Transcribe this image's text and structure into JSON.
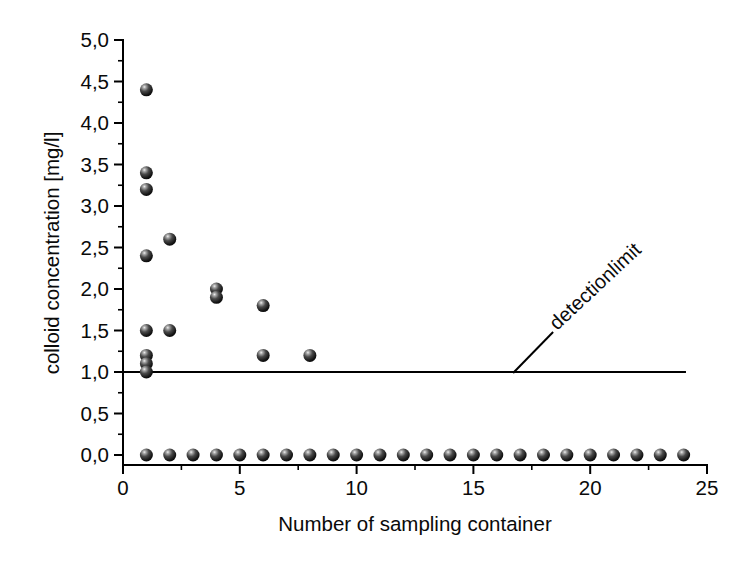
{
  "figure": {
    "background_color": "#ffffff",
    "line_color": "#000000",
    "text_color": "#0a0a0a"
  },
  "chart_data": {
    "type": "scatter",
    "title": "",
    "xlabel": "Number of sampling container",
    "ylabel": "colloid concentration [mg/l]",
    "xlim": [
      0,
      25
    ],
    "ylim": [
      0,
      5
    ],
    "grid": false,
    "legend": "none",
    "x_major_ticks": [
      0,
      5,
      10,
      15,
      20,
      25
    ],
    "x_tick_labels": [
      "0",
      "5",
      "10",
      "15",
      "20",
      "25"
    ],
    "x_minor_ticks": [
      2.5,
      7.5,
      12.5,
      17.5,
      22.5
    ],
    "y_major_ticks": [
      0,
      0.5,
      1,
      1.5,
      2,
      2.5,
      3,
      3.5,
      4,
      4.5,
      5
    ],
    "y_tick_labels": [
      "0,0",
      "0,5",
      "1,0",
      "1,5",
      "2,0",
      "2,5",
      "3,0",
      "3,5",
      "4,0",
      "4,5",
      "5,0"
    ],
    "y_minor_ticks": [
      0.25,
      0.75,
      1.25,
      1.75,
      2.25,
      2.75,
      3.25,
      3.75,
      4.25,
      4.75
    ],
    "marker": {
      "shape": "sphere",
      "base_color": "#000000",
      "highlight_color": "#eeeeee",
      "diameter_px": 13
    },
    "detection_limit": {
      "value": 1.0,
      "label": "detectionlimit",
      "x_range": [
        0,
        24.1
      ],
      "line_color": "#000000"
    },
    "points": [
      [
        1,
        4.4
      ],
      [
        1,
        3.4
      ],
      [
        1,
        3.2
      ],
      [
        1,
        2.4
      ],
      [
        2,
        2.6
      ],
      [
        1,
        1.5
      ],
      [
        2,
        1.5
      ],
      [
        4,
        2.0
      ],
      [
        4,
        1.9
      ],
      [
        6,
        1.8
      ],
      [
        1,
        1.2
      ],
      [
        1,
        1.1
      ],
      [
        1,
        1.0
      ],
      [
        6,
        1.2
      ],
      [
        8,
        1.2
      ],
      [
        1,
        0
      ],
      [
        2,
        0
      ],
      [
        3,
        0
      ],
      [
        4,
        0
      ],
      [
        5,
        0
      ],
      [
        6,
        0
      ],
      [
        7,
        0
      ],
      [
        8,
        0
      ],
      [
        9,
        0
      ],
      [
        10,
        0
      ],
      [
        11,
        0
      ],
      [
        12,
        0
      ],
      [
        13,
        0
      ],
      [
        14,
        0
      ],
      [
        15,
        0
      ],
      [
        16,
        0
      ],
      [
        17,
        0
      ],
      [
        18,
        0
      ],
      [
        19,
        0
      ],
      [
        20,
        0
      ],
      [
        21,
        0
      ],
      [
        22,
        0
      ],
      [
        23,
        0
      ],
      [
        24,
        0
      ]
    ]
  }
}
